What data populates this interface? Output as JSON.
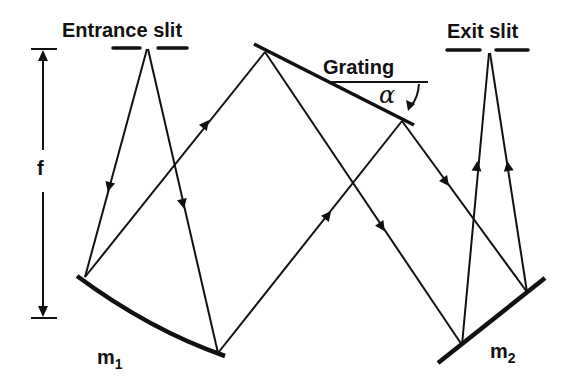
{
  "diagram": {
    "labels": {
      "entrance_slit": "Entrance slit",
      "exit_slit": "Exit slit",
      "grating": "Grating",
      "angle": "α",
      "focal_length": "f",
      "mirror1_base": "m",
      "mirror1_sub": "1",
      "mirror2_base": "m",
      "mirror2_sub": "2"
    },
    "colors": {
      "ink": "#111111",
      "background": "#ffffff"
    },
    "components": [
      {
        "id": "entrance-slit",
        "label": "Entrance slit"
      },
      {
        "id": "mirror-m1",
        "label": "m1",
        "type": "concave collimating mirror"
      },
      {
        "id": "grating",
        "label": "Grating",
        "angle_label": "α"
      },
      {
        "id": "mirror-m2",
        "label": "m2",
        "type": "concave focusing mirror"
      },
      {
        "id": "exit-slit",
        "label": "Exit slit"
      },
      {
        "id": "focal-length",
        "label": "f"
      }
    ]
  }
}
